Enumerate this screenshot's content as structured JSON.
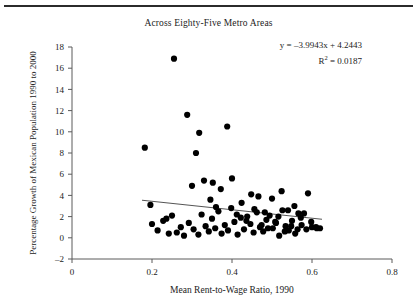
{
  "figure": {
    "title": "Across Eighty-Five Metro Areas",
    "equation_line1": "y = –3.9943x + 4.2443",
    "equation_r2_prefix": "R",
    "equation_r2_sup": "2",
    "equation_r2_value": " = 0.0187",
    "point_color": "#000000",
    "axis_color": "#5a5a5a",
    "trend_color": "#555555",
    "rule_color": "#2b2b2b"
  },
  "chart_data": {
    "type": "scatter",
    "title": "Across Eighty-Five Metro Areas",
    "xlabel": "Mean Rent-to-Wage Ratio, 1990",
    "ylabel": "Percentage Growth of Mexican Population 1990 to 2000",
    "xlim": [
      0,
      0.8
    ],
    "ylim": [
      -2,
      18
    ],
    "xticks": [
      0,
      0.2,
      0.4,
      0.6,
      0.8
    ],
    "xtick_labels": [
      "0",
      "0.2",
      "0.4",
      "0.6",
      "0.8"
    ],
    "yticks": [
      -2,
      0,
      2,
      4,
      6,
      8,
      10,
      12,
      14,
      16,
      18
    ],
    "ytick_labels": [
      "–2",
      "0",
      "2",
      "4",
      "6",
      "8",
      "10",
      "12",
      "14",
      "16",
      "18"
    ],
    "grid": false,
    "legend": "none",
    "annotations": [
      "y = –3.9943x + 4.2443",
      "R² = 0.0187"
    ],
    "trendline": {
      "type": "linear",
      "slope": -3.9943,
      "intercept": 4.2443,
      "r_squared": 0.0187,
      "x_start": 0.175,
      "x_end": 0.625
    },
    "n_points": 85,
    "x": [
      0.255,
      0.318,
      0.288,
      0.31,
      0.182,
      0.388,
      0.352,
      0.196,
      0.236,
      0.3,
      0.33,
      0.346,
      0.36,
      0.372,
      0.4,
      0.412,
      0.424,
      0.436,
      0.448,
      0.456,
      0.466,
      0.474,
      0.482,
      0.49,
      0.5,
      0.508,
      0.516,
      0.524,
      0.532,
      0.54,
      0.548,
      0.556,
      0.564,
      0.572,
      0.58,
      0.59,
      0.6,
      0.612,
      0.62,
      0.2,
      0.214,
      0.228,
      0.242,
      0.25,
      0.262,
      0.272,
      0.28,
      0.292,
      0.304,
      0.316,
      0.324,
      0.334,
      0.342,
      0.35,
      0.358,
      0.366,
      0.374,
      0.382,
      0.39,
      0.398,
      0.406,
      0.414,
      0.422,
      0.43,
      0.438,
      0.446,
      0.454,
      0.462,
      0.47,
      0.478,
      0.486,
      0.494,
      0.502,
      0.51,
      0.518,
      0.526,
      0.534,
      0.542,
      0.55,
      0.558,
      0.566,
      0.574,
      0.586,
      0.598,
      0.61
    ],
    "y": [
      16.9,
      9.9,
      11.6,
      8.0,
      8.5,
      10.5,
      5.2,
      3.1,
      1.8,
      4.9,
      5.4,
      3.6,
      2.9,
      4.6,
      5.6,
      2.2,
      3.3,
      1.6,
      4.1,
      2.7,
      3.9,
      1.2,
      2.4,
      0.9,
      3.7,
      1.5,
      2.0,
      4.4,
      0.6,
      2.6,
      1.1,
      3.0,
      0.8,
      1.9,
      2.3,
      4.2,
      1.0,
      0.9,
      0.9,
      1.3,
      0.7,
      1.6,
      0.4,
      2.1,
      0.5,
      1.0,
      0.2,
      1.4,
      0.8,
      0.3,
      2.2,
      1.1,
      0.6,
      1.8,
      0.9,
      2.5,
      0.4,
      1.2,
      0.7,
      2.8,
      1.5,
      0.3,
      1.9,
      0.8,
      2.0,
      1.3,
      0.5,
      2.4,
      1.0,
      0.6,
      1.7,
      2.1,
      0.9,
      1.4,
      0.2,
      2.6,
      1.1,
      0.7,
      1.6,
      0.4,
      2.3,
      1.2,
      0.8,
      1.5,
      1.0
    ]
  }
}
